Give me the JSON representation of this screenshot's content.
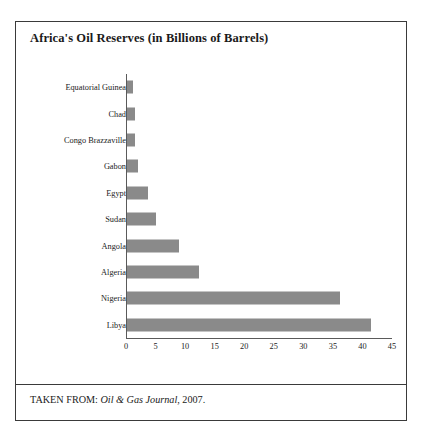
{
  "figure": {
    "title": "Africa's Oil Reserves (in Billions of Barrels)",
    "source_prefix": "TAKEN FROM:",
    "source_italic": "Oil & Gas Journal",
    "source_suffix": ", 2007."
  },
  "colors": {
    "bar": "#8a8a8a",
    "border": "#3a3a3a",
    "axis": "#5a5a5a",
    "text": "#1a1a1a",
    "background": "#ffffff"
  },
  "chart_data": {
    "type": "bar",
    "orientation": "horizontal",
    "title": "Africa's Oil Reserves (in Billions of Barrels)",
    "xlabel": "",
    "ylabel": "",
    "xlim": [
      0,
      45
    ],
    "grid": false,
    "legend": false,
    "xticks": [
      0,
      5,
      10,
      15,
      20,
      25,
      30,
      35,
      40,
      45
    ],
    "categories": [
      "Equatorial Guinea",
      "Chad",
      "Congo Brazzaville",
      "Gabon",
      "Egypt",
      "Sudan",
      "Angola",
      "Algeria",
      "Nigeria",
      "Libya"
    ],
    "values": [
      1.1,
      1.5,
      1.6,
      2.0,
      3.7,
      5.0,
      9.0,
      12.3,
      36.2,
      41.5
    ],
    "units": "billions of barrels"
  }
}
